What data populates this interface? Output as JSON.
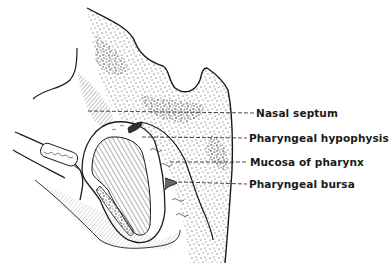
{
  "figure": {
    "labels": [
      {
        "id": "nasal-septum",
        "text": "Nasal septum",
        "x": 256,
        "y": 107
      },
      {
        "id": "pharyngeal-hypophysis",
        "text": "Pharyngeal hypophysis",
        "x": 249,
        "y": 132
      },
      {
        "id": "mucosa-of-pharynx",
        "text": "Mucosa of pharynx",
        "x": 250,
        "y": 156
      },
      {
        "id": "pharyngeal-bursa",
        "text": "Pharyngeal bursa",
        "x": 249,
        "y": 178
      }
    ],
    "colors": {
      "ink": "#1a1a1a",
      "background": "#ffffff"
    }
  }
}
